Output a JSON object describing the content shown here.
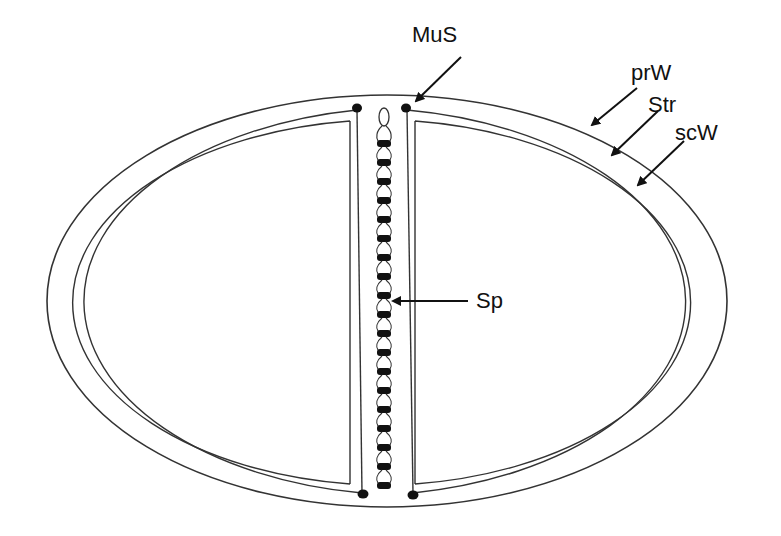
{
  "diagram": {
    "type": "cross-section",
    "labels": {
      "mus": "MuS",
      "prw": "prW",
      "str": "Str",
      "scw": "scW",
      "sp": "Sp"
    },
    "colors": {
      "line": "#222222",
      "fill": "#ffffff",
      "dot": "#111111"
    }
  }
}
